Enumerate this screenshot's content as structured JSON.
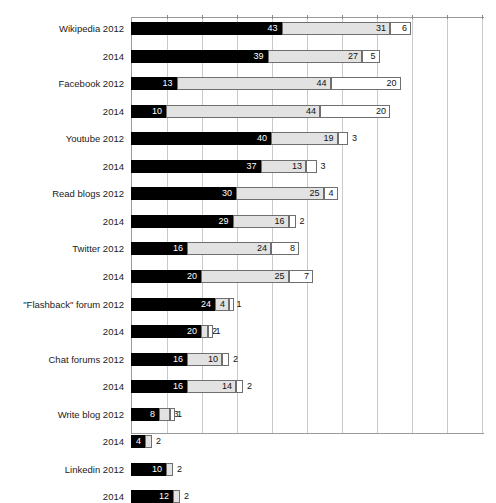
{
  "chart_data": {
    "type": "bar",
    "orientation": "horizontal",
    "stacked": true,
    "title": "",
    "subtitle": "",
    "xlabel": "",
    "ylabel": "",
    "xlim": [
      0,
      100
    ],
    "x_tick_interval": 10,
    "grid": true,
    "legend_position": "none",
    "series": [
      {
        "name": "Series 1",
        "color": "#000000"
      },
      {
        "name": "Series 2",
        "color": "#e2e2e2"
      },
      {
        "name": "Series 3",
        "color": "#ffffff"
      }
    ],
    "categories": [
      "Wikipedia 2012",
      "2014",
      "Facebook 2012",
      "2014",
      "Youtube 2012",
      "2014",
      "Read blogs 2012",
      "2014",
      "Twitter 2012",
      "2014",
      "\"Flashback\" forum 2012",
      "2014",
      "Chat forums 2012",
      "2014",
      "Write blog 2012",
      "2014",
      "Linkedin 2012",
      "2014"
    ],
    "rows": [
      {
        "label": "Wikipedia 2012",
        "values": [
          43,
          31,
          6
        ],
        "labels": [
          "43",
          "31",
          "6"
        ]
      },
      {
        "label": "2014",
        "values": [
          39,
          27,
          5
        ],
        "labels": [
          "39",
          "27",
          "5"
        ]
      },
      {
        "label": "Facebook 2012",
        "values": [
          13,
          44,
          20
        ],
        "labels": [
          "13",
          "44",
          "20"
        ]
      },
      {
        "label": "2014",
        "values": [
          10,
          44,
          20
        ],
        "labels": [
          "10",
          "44",
          "20"
        ]
      },
      {
        "label": "Youtube 2012",
        "values": [
          40,
          19,
          3
        ],
        "labels": [
          "40",
          "19",
          "3"
        ]
      },
      {
        "label": "2014",
        "values": [
          37,
          13,
          3
        ],
        "labels": [
          "37",
          "13",
          "3"
        ]
      },
      {
        "label": "Read blogs 2012",
        "values": [
          30,
          25,
          4
        ],
        "labels": [
          "30",
          "25",
          "4"
        ]
      },
      {
        "label": "2014",
        "values": [
          29,
          16,
          2
        ],
        "labels": [
          "29",
          "16",
          "2"
        ]
      },
      {
        "label": "Twitter 2012",
        "values": [
          16,
          24,
          8
        ],
        "labels": [
          "16",
          "24",
          "8"
        ]
      },
      {
        "label": "2014",
        "values": [
          20,
          25,
          7
        ],
        "labels": [
          "20",
          "25",
          "7"
        ]
      },
      {
        "label": "\"Flashback\" forum 2012",
        "values": [
          24,
          4,
          1
        ],
        "labels": [
          "24",
          "4",
          "1"
        ]
      },
      {
        "label": "2014",
        "values": [
          20,
          2,
          1
        ],
        "labels": [
          "20",
          "2",
          "1"
        ]
      },
      {
        "label": "Chat forums 2012",
        "values": [
          16,
          10,
          2
        ],
        "labels": [
          "16",
          "10",
          "2"
        ]
      },
      {
        "label": "2014",
        "values": [
          16,
          14,
          2
        ],
        "labels": [
          "16",
          "14",
          "2"
        ]
      },
      {
        "label": "Write blog 2012",
        "values": [
          8,
          3,
          1
        ],
        "labels": [
          "8",
          "3",
          "1"
        ]
      },
      {
        "label": "2014",
        "values": [
          4,
          2,
          0
        ],
        "labels": [
          "4",
          "2",
          ""
        ]
      },
      {
        "label": "Linkedin 2012",
        "values": [
          10,
          2,
          0
        ],
        "labels": [
          "10",
          "2",
          ""
        ]
      },
      {
        "label": "2014",
        "values": [
          12,
          2,
          0
        ],
        "labels": [
          "12",
          "2",
          ""
        ]
      }
    ]
  },
  "axis": {
    "x_ticks": [
      "0",
      "10",
      "20",
      "30",
      "40",
      "50",
      "60",
      "70",
      "80",
      "90",
      "100"
    ]
  }
}
